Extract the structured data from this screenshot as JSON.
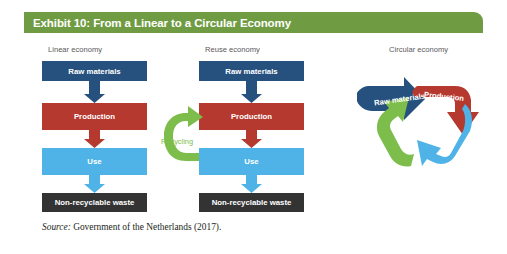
{
  "exhibit": {
    "title": "Exhibit 10: From a Linear to a Circular Economy",
    "title_bar_color": "#6f9c43",
    "source_keyword": "Source:",
    "source_text": " Government of the Netherlands (2017)."
  },
  "palette": {
    "raw_materials": "#26507d",
    "production": "#b5392e",
    "use": "#4fb3e8",
    "waste": "#333333",
    "recycling": "#7dbd4c",
    "caption_text": "#58585a"
  },
  "columns": [
    {
      "id": "linear",
      "caption": "Linear economy",
      "boxes": [
        {
          "label": "Raw materials",
          "color": "#26507d"
        },
        {
          "label": "Production",
          "color": "#b5392e"
        },
        {
          "label": "Use",
          "color": "#4fb3e8"
        },
        {
          "label": "Non-recyclable waste",
          "color": "#333333"
        }
      ],
      "has_recycling_loop": false
    },
    {
      "id": "reuse",
      "caption": "Reuse economy",
      "boxes": [
        {
          "label": "Raw materials",
          "color": "#26507d"
        },
        {
          "label": "Production",
          "color": "#b5392e"
        },
        {
          "label": "Use",
          "color": "#4fb3e8"
        },
        {
          "label": "Non-recyclable waste",
          "color": "#333333"
        }
      ],
      "has_recycling_loop": true,
      "recycling_label": "Recycling"
    },
    {
      "id": "circular",
      "caption": "Circular economy",
      "arrows": [
        {
          "label": "Raw materials",
          "color": "#26507d"
        },
        {
          "label": "Production",
          "color": "#b5392e"
        },
        {
          "label": "Use",
          "color": "#4fb3e8"
        },
        {
          "label": "Recycling",
          "color": "#7dbd4c"
        }
      ]
    }
  ]
}
